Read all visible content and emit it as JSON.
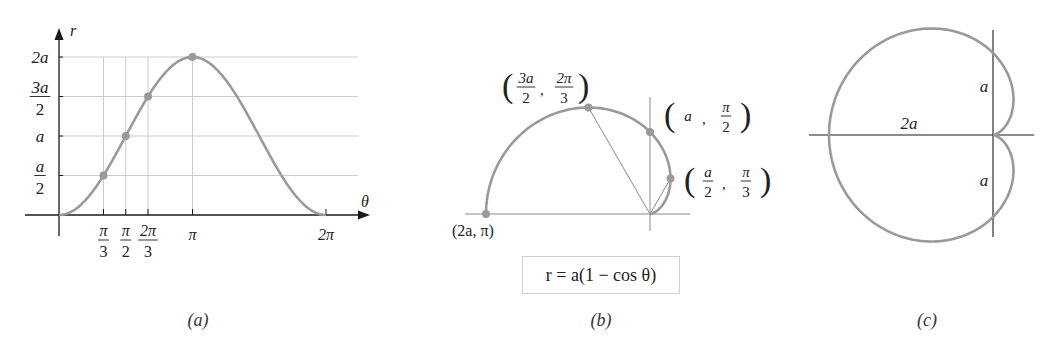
{
  "figure": {
    "panels": [
      {
        "id": "a",
        "caption": "(a)"
      },
      {
        "id": "b",
        "caption": "(b)"
      },
      {
        "id": "c",
        "caption": "(c)"
      }
    ],
    "equation": "r = a(1 − cos θ)",
    "colors": {
      "curve": "#9a9a9a",
      "axis": "#1a1a1a",
      "grid": "#cccccc",
      "point": "#9a9a9a"
    }
  },
  "panel_a": {
    "y_axis_label": "r",
    "x_axis_label": "θ",
    "y_ticks": [
      {
        "value": 0.5,
        "num": "a",
        "den": "2"
      },
      {
        "value": 1.0,
        "text": "a"
      },
      {
        "value": 1.5,
        "num": "3a",
        "den": "2"
      },
      {
        "value": 2.0,
        "text": "2a"
      }
    ],
    "x_ticks": [
      {
        "value": 1.0472,
        "num": "π",
        "den": "3"
      },
      {
        "value": 1.5708,
        "num": "π",
        "den": "2"
      },
      {
        "value": 2.0944,
        "num": "2π",
        "den": "3"
      },
      {
        "value": 3.1416,
        "text": "π"
      },
      {
        "value": 6.2832,
        "text": "2π"
      }
    ],
    "points": [
      {
        "theta": "π/3",
        "r": "a/2"
      },
      {
        "theta": "π/2",
        "r": "a"
      },
      {
        "theta": "2π/3",
        "r": "3a/2"
      },
      {
        "theta": "π",
        "r": "2a"
      }
    ]
  },
  "panel_b": {
    "points": [
      {
        "label_r": "2a",
        "label_theta": "π",
        "theta": 3.1416,
        "r": 2.0
      },
      {
        "label_r_num": "3a",
        "label_r_den": "2",
        "label_theta_num": "2π",
        "label_theta_den": "3",
        "theta": 2.0944,
        "r": 1.5
      },
      {
        "label_r": "a",
        "label_theta_num": "π",
        "label_theta_den": "2",
        "theta": 1.5708,
        "r": 1.0
      },
      {
        "label_r_num": "a",
        "label_r_den": "2",
        "label_theta_num": "π",
        "label_theta_den": "3",
        "theta": 1.0472,
        "r": 0.5
      }
    ],
    "label_2a_pi": "(2a, π)"
  },
  "panel_c": {
    "label_width": "2a",
    "label_upper": "a",
    "label_lower": "a"
  },
  "chart_data": [
    {
      "type": "line",
      "title": "(a) r = a(1 − cos θ) in Cartesian θ-r plane",
      "xlabel": "θ",
      "ylabel": "r",
      "xlim": [
        0,
        6.2832
      ],
      "ylim": [
        0,
        2
      ],
      "x_tick_labels": [
        "π/3",
        "π/2",
        "2π/3",
        "π",
        "2π"
      ],
      "y_tick_labels": [
        "a/2",
        "a",
        "3a/2",
        "2a"
      ],
      "grid": true,
      "series": [
        {
          "name": "r = a(1 − cos θ)",
          "x": [
            0,
            1.0472,
            1.5708,
            2.0944,
            3.1416,
            4.1888,
            4.7124,
            5.236,
            6.2832
          ],
          "values": [
            0,
            0.5,
            1.0,
            1.5,
            2.0,
            1.5,
            1.0,
            0.5,
            0
          ]
        }
      ],
      "marked_points": [
        [
          1.0472,
          0.5
        ],
        [
          1.5708,
          1.0
        ],
        [
          2.0944,
          1.5
        ],
        [
          3.1416,
          2.0
        ]
      ]
    },
    {
      "type": "line",
      "title": "(b) polar trace for 0 ≤ θ ≤ π",
      "equation": "r = a(1 − cos θ)",
      "marked_points": [
        {
          "r": "a/2",
          "theta": "π/3"
        },
        {
          "r": "a",
          "theta": "π/2"
        },
        {
          "r": "3a/2",
          "theta": "2π/3"
        },
        {
          "r": "2a",
          "theta": "π"
        }
      ]
    },
    {
      "type": "line",
      "title": "(c) full cardioid",
      "annotations": [
        "2a",
        "a",
        "a"
      ]
    }
  ]
}
